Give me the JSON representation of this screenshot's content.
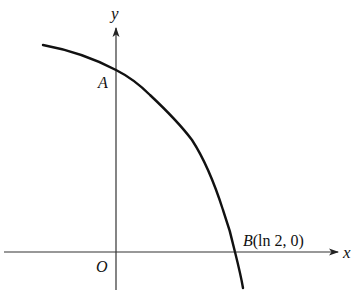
{
  "diagram": {
    "type": "function-graph",
    "axes": {
      "x_label": "x",
      "y_label": "y",
      "origin_label": "O"
    },
    "points": {
      "A": {
        "label": "A",
        "description": "y-intercept of curve"
      },
      "B": {
        "label_letter": "B",
        "label_coords": "(ln 2, 0)",
        "description": "x-intercept of curve"
      }
    },
    "curve": {
      "description": "decreasing concave-down curve crossing y-axis at A and x-axis at B",
      "stroke": "#111111"
    },
    "colors": {
      "axis": "#333333",
      "curve": "#111111",
      "background": "#ffffff"
    }
  }
}
